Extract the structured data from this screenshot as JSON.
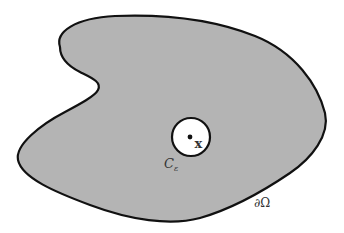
{
  "diagram": {
    "colors": {
      "region_fill": "#b4b4b4",
      "boundary_stroke": "#111111",
      "hole_fill": "#ffffff",
      "label": "#333333"
    },
    "labels": {
      "point": "x",
      "circle": "C",
      "circle_subscript": "ε",
      "boundary": "∂Ω"
    }
  }
}
